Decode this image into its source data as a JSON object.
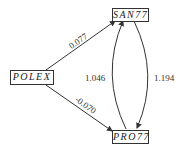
{
  "nodes": {
    "polex": "POLEX",
    "san77": "SAN77",
    "pro77": "PRO77"
  },
  "edges": {
    "polex_san77": "0.077",
    "polex_pro77": "-0.070",
    "pro77_san77": "1.046",
    "san77_pro77": "1.194"
  }
}
